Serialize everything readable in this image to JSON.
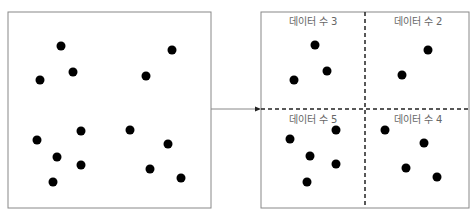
{
  "left_panel": {
    "points": [
      [
        61,
        46
      ],
      [
        172,
        50
      ],
      [
        73,
        72
      ],
      [
        40,
        80
      ],
      [
        146,
        76
      ],
      [
        81,
        131
      ],
      [
        130,
        130
      ],
      [
        37,
        140
      ],
      [
        168,
        144
      ],
      [
        57,
        157
      ],
      [
        81,
        165
      ],
      [
        150,
        169
      ],
      [
        53,
        182
      ],
      [
        181,
        178
      ]
    ]
  },
  "right_panel": {
    "quadrants": [
      {
        "label": "데이터 수 3",
        "count": 3,
        "points": [
          [
            315,
            45
          ],
          [
            327,
            71
          ],
          [
            294,
            80
          ]
        ]
      },
      {
        "label": "데이터 수 2",
        "count": 2,
        "points": [
          [
            428,
            50
          ],
          [
            402,
            75
          ]
        ]
      },
      {
        "label": "데이터 수 5",
        "count": 5,
        "points": [
          [
            336,
            130
          ],
          [
            290,
            139
          ],
          [
            310,
            156
          ],
          [
            336,
            164
          ],
          [
            307,
            182
          ]
        ]
      },
      {
        "label": "데이터 수 4",
        "count": 4,
        "points": [
          [
            385,
            130
          ],
          [
            424,
            143
          ],
          [
            406,
            168
          ],
          [
            437,
            177
          ]
        ]
      }
    ]
  },
  "colors": {
    "border": "#888888",
    "dot": "#000000",
    "divider": "#222222",
    "label": "#666666"
  }
}
